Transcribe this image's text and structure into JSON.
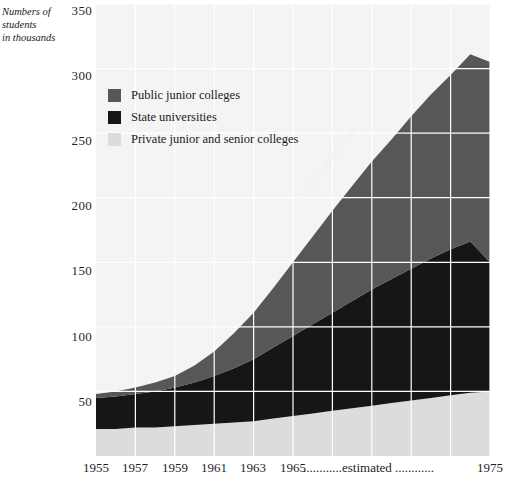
{
  "axis": {
    "y_caption": "Numbers of students in thousands",
    "y_caption_lines": [
      "Numbers of",
      "students",
      "in thousands"
    ],
    "y_ticks": [
      "350",
      "300",
      "250",
      "200",
      "150",
      "100",
      "50"
    ],
    "x_ticks": [
      "1955",
      "1957",
      "1959",
      "1961",
      "1963",
      "1965",
      "1975"
    ],
    "estimated_note": "............estimated ............"
  },
  "legend": {
    "items": [
      {
        "label": "Public junior colleges",
        "color": "#575757"
      },
      {
        "label": "State universities",
        "color": "#161616"
      },
      {
        "label": "Private junior and senior colleges",
        "color": "#dcdcdc"
      }
    ]
  },
  "annotations": {
    "total": "Total enrollments"
  },
  "colors": {
    "plot_background": "#f4f4f4",
    "gridline": "#ffffff",
    "public_junior": "#575757",
    "state_universities": "#161616",
    "private_colleges": "#dcdcdc",
    "text": "#1a1a1a"
  },
  "chart_data": {
    "type": "area",
    "title": "",
    "xlabel": "",
    "ylabel": "Numbers of students in thousands",
    "stacked": true,
    "grid": true,
    "legend_position": "inside-top-left",
    "xlim": [
      1955,
      1975
    ],
    "ylim": [
      0,
      350
    ],
    "ytick_values": [
      50,
      100,
      150,
      200,
      250,
      300,
      350
    ],
    "xtick_values": [
      1955,
      1957,
      1959,
      1961,
      1963,
      1965,
      1975
    ],
    "x": [
      1955,
      1956,
      1957,
      1958,
      1959,
      1960,
      1961,
      1962,
      1963,
      1964,
      1965,
      1966,
      1967,
      1968,
      1969,
      1970,
      1971,
      1972,
      1973,
      1974,
      1975
    ],
    "series": [
      {
        "name": "Private junior and senior colleges",
        "color": "#dcdcdc",
        "values": [
          21,
          21,
          22,
          22,
          23,
          24,
          25,
          26,
          27,
          29,
          31,
          33,
          35,
          37,
          39,
          41,
          43,
          45,
          47,
          49,
          50
        ]
      },
      {
        "name": "State universities",
        "color": "#161616",
        "values": [
          24,
          25,
          26,
          28,
          30,
          33,
          37,
          42,
          48,
          55,
          62,
          69,
          76,
          83,
          90,
          96,
          102,
          108,
          113,
          117,
          100
        ]
      },
      {
        "name": "Public junior colleges",
        "color": "#575757",
        "values": [
          3,
          4,
          5,
          7,
          9,
          13,
          19,
          27,
          36,
          46,
          57,
          68,
          79,
          89,
          99,
          108,
          118,
          127,
          135,
          145,
          155
        ]
      }
    ],
    "totals": [
      48,
      50,
      53,
      57,
      62,
      70,
      81,
      95,
      111,
      130,
      150,
      170,
      190,
      209,
      228,
      245,
      263,
      280,
      295,
      311,
      305
    ],
    "annotations": [
      {
        "text": "Total enrollments",
        "x": 1965,
        "y": 150,
        "rotation": -52
      }
    ]
  }
}
